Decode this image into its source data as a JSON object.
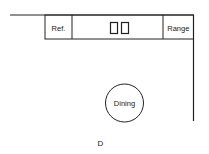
{
  "diagram": {
    "type": "kitchen-floor-plan",
    "caption": "D",
    "appliances": {
      "refrigerator": "Ref.",
      "sink": "",
      "range": "Range"
    },
    "dining": "Dining",
    "colors": {
      "line": "#222222",
      "background": "#ffffff"
    }
  }
}
